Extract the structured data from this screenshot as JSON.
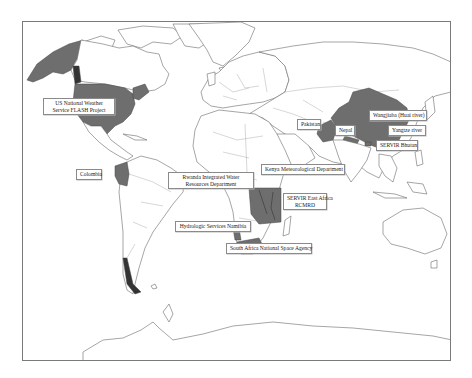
{
  "map": {
    "title": "",
    "highlight_color": "#6e6e6e",
    "land_fill": "#ffffff",
    "outline_color": "#6a6a6a"
  },
  "labels": [
    {
      "id": "us",
      "line1": "US National Weather",
      "line2": "Service FLASH Project"
    },
    {
      "id": "colombia",
      "line1": "Colombia",
      "line2": ""
    },
    {
      "id": "rwanda",
      "line1": "Rwanda Integrated Water",
      "line2": "Resources Department"
    },
    {
      "id": "kenya",
      "line1": "Kenya Meteorological Department",
      "line2": ""
    },
    {
      "id": "servir_ea",
      "line1": "SERVIR East Africa",
      "line2": "RCMRD"
    },
    {
      "id": "namibia",
      "line1": "Hydrologic Services Namibia",
      "line2": ""
    },
    {
      "id": "south_africa",
      "line1": "South Africa National Space Agency",
      "line2": ""
    },
    {
      "id": "pakistan",
      "line1": "Pakistan",
      "line2": ""
    },
    {
      "id": "nepal",
      "line1": "Nepal",
      "line2": ""
    },
    {
      "id": "wangjiaba",
      "line1": "Wangjiaba (Huai river)",
      "line2": ""
    },
    {
      "id": "yangtze",
      "line1": "Yangtze river",
      "line2": ""
    },
    {
      "id": "servir_bhutan",
      "line1": "SERVIR Bhutan",
      "line2": ""
    }
  ],
  "highlighted_regions": [
    "United States (incl. Alaska)",
    "Colombia",
    "Rwanda",
    "Kenya / East Africa",
    "Namibia",
    "South Africa",
    "Pakistan",
    "Nepal",
    "China",
    "Bhutan",
    "Southern Chile / Patagonia"
  ]
}
